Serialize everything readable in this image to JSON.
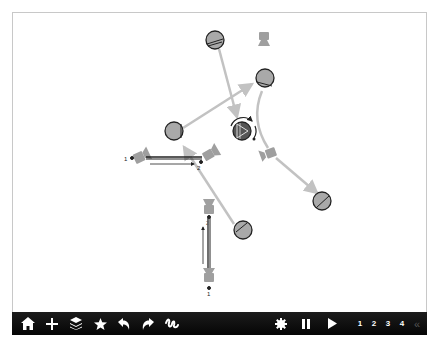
{
  "toolbar": {
    "left_tools": [
      {
        "name": "home",
        "icon": "home-icon"
      },
      {
        "name": "add",
        "icon": "plus-icon"
      },
      {
        "name": "layers",
        "icon": "layers-icon"
      },
      {
        "name": "favorite",
        "icon": "star-icon"
      },
      {
        "name": "undo",
        "icon": "undo-icon"
      },
      {
        "name": "redo",
        "icon": "redo-icon"
      },
      {
        "name": "draw",
        "icon": "squiggle-icon"
      }
    ],
    "right_tools": [
      {
        "name": "settings",
        "icon": "gear-icon"
      },
      {
        "name": "pause",
        "icon": "pause-icon"
      },
      {
        "name": "play",
        "icon": "play-icon"
      }
    ],
    "pages": [
      "1",
      "2",
      "3",
      "4"
    ],
    "collapse_label": "«"
  },
  "scene": {
    "labels": {
      "left_pair_start": "1",
      "left_pair_end": "2",
      "vertical_pair_bottom": "1",
      "vertical_pair_top": "2"
    },
    "colors": {
      "node_fill": "#a9a9a9",
      "arrow": "#c2c2c2",
      "dark": "#222222",
      "background": "#ffffff",
      "toolbar": "#0d0d0d"
    }
  }
}
